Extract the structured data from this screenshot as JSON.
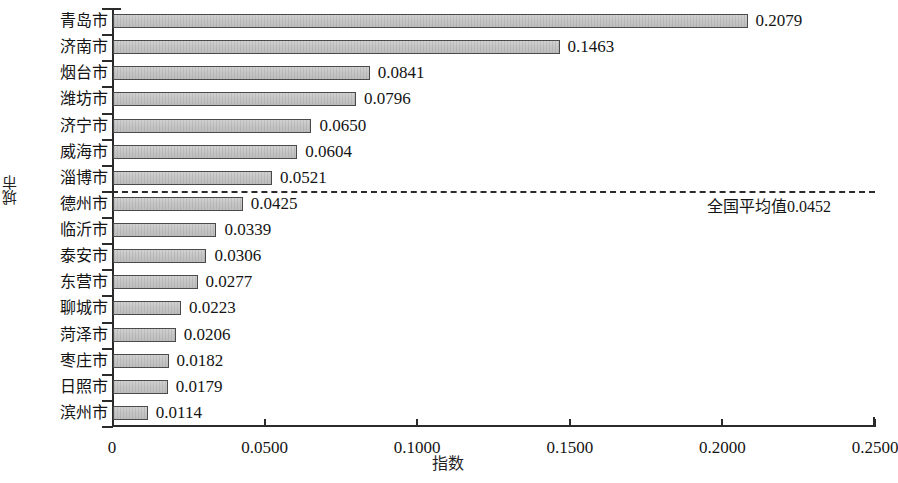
{
  "chart_data": {
    "type": "bar",
    "orientation": "horizontal",
    "title": "",
    "xlabel": "指数",
    "ylabel": "城市",
    "xlim": [
      0,
      0.25
    ],
    "xticks": [
      0,
      0.05,
      0.1,
      0.15,
      0.2,
      0.25
    ],
    "xtick_labels": [
      "0",
      "0.0500",
      "0.1000",
      "0.1500",
      "0.2000",
      "0.2500"
    ],
    "grid": false,
    "legend": null,
    "categories": [
      "青岛市",
      "济南市",
      "烟台市",
      "潍坊市",
      "济宁市",
      "威海市",
      "淄博市",
      "德州市",
      "临沂市",
      "泰安市",
      "东营市",
      "聊城市",
      "菏泽市",
      "枣庄市",
      "日照市",
      "滨州市"
    ],
    "values": [
      0.2079,
      0.1463,
      0.0841,
      0.0796,
      0.065,
      0.0604,
      0.0521,
      0.0425,
      0.0339,
      0.0306,
      0.0277,
      0.0223,
      0.0206,
      0.0182,
      0.0179,
      0.0114
    ],
    "value_labels": [
      "0.2079",
      "0.1463",
      "0.0841",
      "0.0796",
      "0.0650",
      "0.0604",
      "0.0521",
      "0.0425",
      "0.0339",
      "0.0306",
      "0.0277",
      "0.0223",
      "0.0206",
      "0.0182",
      "0.0179",
      "0.0114"
    ],
    "annotations": [
      {
        "type": "reference-line",
        "style": "dashed",
        "label": "全国平均值0.0452",
        "value": 0.0452,
        "position_after_category_index": 6
      }
    ],
    "colors": {
      "bar_fill": "#c6c6c6",
      "bar_border": "#4a4a4a",
      "axis": "#2b2b2b",
      "text": "#141414"
    }
  }
}
